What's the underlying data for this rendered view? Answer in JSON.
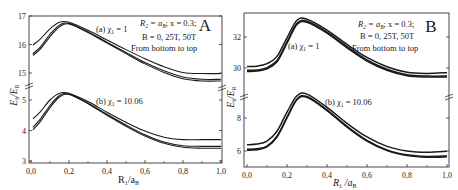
{
  "chart_data": [
    {
      "panel": "A",
      "type": "line",
      "panel_label": "A",
      "xlabel": "R1/aB",
      "ylabel": "Eb/ER",
      "xlim": [
        0.0,
        1.0
      ],
      "x_ticks": [
        "0,0",
        "0,2",
        "0,4",
        "0,6",
        "0,8",
        "1,0"
      ],
      "broken_y_axis": true,
      "y_ticks_upper": [
        "15",
        "16",
        "17"
      ],
      "y_ticks_lower": [
        "3",
        "4",
        "5"
      ],
      "ylim_upper": [
        14.7,
        17.0
      ],
      "ylim_lower": [
        3.0,
        5.6
      ],
      "annotation": {
        "line1": "R2 = aB;  x = 0.3;",
        "line2": "B = 0, 25T, 50T",
        "line3": "From bottom to top"
      },
      "group_labels": {
        "a": "(a) χ1 = 1",
        "b": "(b) χ1 = 10.06"
      },
      "x": [
        0.01,
        0.05,
        0.1,
        0.15,
        0.2,
        0.3,
        0.4,
        0.5,
        0.6,
        0.7,
        0.8,
        0.9,
        1.0
      ],
      "series": [
        {
          "name": "(a) B=0",
          "group": "upper",
          "values": [
            15.62,
            15.85,
            16.28,
            16.62,
            16.72,
            16.42,
            16.05,
            15.68,
            15.32,
            15.02,
            14.8,
            14.72,
            14.72
          ]
        },
        {
          "name": "(a) B=25T",
          "group": "upper",
          "values": [
            15.68,
            15.92,
            16.36,
            16.68,
            16.74,
            16.45,
            16.08,
            15.72,
            15.37,
            15.08,
            14.86,
            14.78,
            14.78
          ]
        },
        {
          "name": "(a) B=50T",
          "group": "upper",
          "values": [
            15.98,
            16.2,
            16.55,
            16.78,
            16.78,
            16.5,
            16.16,
            15.82,
            15.5,
            15.22,
            15.02,
            14.98,
            14.98
          ]
        },
        {
          "name": "(b) B=0",
          "group": "lower",
          "values": [
            4.02,
            4.3,
            4.75,
            5.1,
            5.18,
            4.88,
            4.5,
            4.14,
            3.82,
            3.58,
            3.45,
            3.42,
            3.42
          ]
        },
        {
          "name": "(b) B=25T",
          "group": "lower",
          "values": [
            4.1,
            4.38,
            4.82,
            5.15,
            5.2,
            4.9,
            4.53,
            4.18,
            3.86,
            3.62,
            3.5,
            3.48,
            3.48
          ]
        },
        {
          "name": "(b) B=50T",
          "group": "lower",
          "values": [
            4.38,
            4.62,
            5.0,
            5.22,
            5.22,
            4.95,
            4.6,
            4.27,
            3.98,
            3.78,
            3.7,
            3.7,
            3.7
          ]
        }
      ]
    },
    {
      "panel": "B",
      "type": "line",
      "panel_label": "B",
      "xlabel": "R1/aB",
      "ylabel": "Eb/ER",
      "xlim": [
        0.0,
        1.0
      ],
      "x_ticks": [
        "0,0",
        "0,2",
        "0,4",
        "0,6",
        "0,8",
        "1,0"
      ],
      "broken_y_axis": true,
      "y_ticks_upper": [
        "30",
        "32"
      ],
      "y_ticks_lower": [
        "6",
        "8"
      ],
      "ylim_upper": [
        29.0,
        33.5
      ],
      "ylim_lower": [
        5.2,
        9.6
      ],
      "annotation": {
        "line1": "R2 = aB;  x = 0.3;",
        "line2": "B = 0, 25T, 50T",
        "line3": "From bottom to top"
      },
      "group_labels": {
        "a": "(a) χ1 = 1",
        "b": "(b) χ1 = 10.06"
      },
      "x": [
        0.0,
        0.05,
        0.1,
        0.15,
        0.2,
        0.25,
        0.3,
        0.4,
        0.5,
        0.6,
        0.7,
        0.8,
        0.9,
        1.0
      ],
      "series": [
        {
          "name": "(a) B=0",
          "group": "upper",
          "values": [
            29.78,
            29.8,
            29.95,
            30.4,
            31.6,
            32.8,
            32.95,
            32.25,
            31.3,
            30.45,
            29.85,
            29.5,
            29.42,
            29.42
          ]
        },
        {
          "name": "(a) B=25T",
          "group": "upper",
          "values": [
            29.85,
            29.87,
            30.02,
            30.48,
            31.68,
            32.88,
            33.02,
            32.32,
            31.38,
            30.52,
            29.92,
            29.57,
            29.48,
            29.48
          ]
        },
        {
          "name": "(a) B=50T",
          "group": "upper",
          "values": [
            30.1,
            30.12,
            30.28,
            30.75,
            31.95,
            33.08,
            33.15,
            32.45,
            31.52,
            30.68,
            30.08,
            29.72,
            29.65,
            29.7
          ]
        },
        {
          "name": "(b) B=0",
          "group": "lower",
          "values": [
            6.05,
            6.08,
            6.25,
            6.85,
            8.0,
            9.1,
            9.25,
            8.45,
            7.45,
            6.6,
            6.02,
            5.72,
            5.62,
            5.65
          ]
        },
        {
          "name": "(b) B=25T",
          "group": "lower",
          "values": [
            6.1,
            6.13,
            6.3,
            6.9,
            8.05,
            9.15,
            9.3,
            8.5,
            7.5,
            6.65,
            6.07,
            5.77,
            5.67,
            5.7
          ]
        },
        {
          "name": "(b) B=50T",
          "group": "lower",
          "values": [
            6.38,
            6.42,
            6.6,
            7.2,
            8.35,
            9.35,
            9.45,
            8.65,
            7.68,
            6.85,
            6.28,
            6.0,
            5.92,
            5.98
          ]
        }
      ]
    }
  ],
  "panels": {
    "A": {
      "label": "A",
      "ylabel_main": "E",
      "ylabel_sub1": "b",
      "ylabel_sep": "/E",
      "ylabel_sub2": "R",
      "xlabel_main": "R",
      "xlabel_sub1": "1",
      "xlabel_sep": "/a",
      "xlabel_sub2": "B",
      "x_ticks": [
        "0,0",
        "0,2",
        "0,4",
        "0,6",
        "0,8",
        "1,0"
      ],
      "y_ticks": [
        "17",
        "16",
        "15",
        "5",
        "4",
        "3"
      ],
      "annot_line1_a": "R",
      "annot_line1_b": "2",
      "annot_line1_c": " = a",
      "annot_line1_d": "B",
      "annot_line1_e": ";  x = 0.3;",
      "annot_line2": "B = 0, 25T, 50T",
      "annot_line3": "From bottom to top",
      "group_a_prefix": "(a) χ",
      "group_a_sub": "1",
      "group_a_value": " = 1",
      "group_b_prefix": "(b) χ",
      "group_b_sub": "1",
      "group_b_value": " = 10.06"
    },
    "B": {
      "label": "B",
      "ylabel_main": "E",
      "ylabel_sub1": "b",
      "ylabel_sep": "/E",
      "ylabel_sub2": "R",
      "xlabel_main": "R",
      "xlabel_sub1": "1",
      "xlabel_sep": " /a",
      "xlabel_sub2": "B",
      "x_ticks": [
        "0,0",
        "0,2",
        "0,4",
        "0,6",
        "0,8",
        "1,0"
      ],
      "y_ticks": [
        "32",
        "30",
        "8",
        "6"
      ],
      "annot_line1_a": "R",
      "annot_line1_b": "2",
      "annot_line1_c": " = a",
      "annot_line1_d": "B",
      "annot_line1_e": ";  x = 0.3;",
      "annot_line2": "B = 0, 25T, 50T",
      "annot_line3": "From bottom to top",
      "group_a_prefix": "(a) χ",
      "group_a_sub": "1",
      "group_a_value": " = 1",
      "group_b_prefix": "(b) χ",
      "group_b_sub": "1",
      "group_b_value": " = 10.06"
    }
  },
  "colors": {
    "line": "#1a1a1a",
    "axis": "#333333",
    "background": "#ffffff"
  }
}
